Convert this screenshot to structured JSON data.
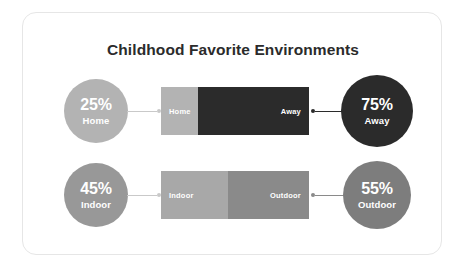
{
  "chart_data": {
    "type": "bar",
    "title": "Childhood Favorite Environments",
    "xlabel": "",
    "ylabel": "",
    "orientation": "horizontal",
    "stacked": true,
    "normalized_to_percent": true,
    "xlim": [
      0,
      100
    ],
    "grid": false,
    "legend": "none",
    "rows": [
      {
        "categories": [
          "Home",
          "Away"
        ],
        "values": [
          25,
          75
        ],
        "value_labels": [
          "25%",
          "75%"
        ]
      },
      {
        "categories": [
          "Indoor",
          "Outdoor"
        ],
        "values": [
          45,
          55
        ],
        "value_labels": [
          "45%",
          "55%"
        ]
      }
    ]
  },
  "card": {
    "title": "Childhood Favorite Environments"
  },
  "rows": [
    {
      "left_bubble": {
        "percent": "25%",
        "label": "Home",
        "color": "#b3b3b3"
      },
      "right_bubble": {
        "percent": "75%",
        "label": "Away",
        "color": "#2b2b2b"
      },
      "bar": {
        "left_segment": {
          "label": "Home",
          "percent": 25,
          "color": "#b3b3b3"
        },
        "right_segment": {
          "label": "Away",
          "percent": 75,
          "color": "#2b2b2b"
        }
      },
      "connector_left_color": "#c9c9c9",
      "connector_right_color": "#2b2b2b"
    },
    {
      "left_bubble": {
        "percent": "45%",
        "label": "Indoor",
        "color": "#989898"
      },
      "right_bubble": {
        "percent": "55%",
        "label": "Outdoor",
        "color": "#7d7d7d"
      },
      "bar": {
        "left_segment": {
          "label": "Indoor",
          "percent": 45,
          "color": "#a8a8a8"
        },
        "right_segment": {
          "label": "Outdoor",
          "percent": 55,
          "color": "#8a8a8a"
        }
      },
      "connector_left_color": "#c9c9c9",
      "connector_right_color": "#8a8a8a"
    }
  ],
  "colors": {
    "background": "#ffffff",
    "card_border": "#e6e6e6",
    "title_text": "#2b2b2b",
    "bubble_text": "#ffffff",
    "segment_text": "#ffffff"
  }
}
